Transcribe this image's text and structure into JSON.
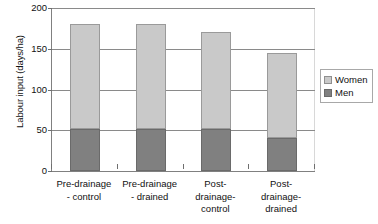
{
  "chart_data": {
    "type": "bar",
    "subtype": "stacked-column",
    "title": "",
    "xlabel": "",
    "ylabel": "Labour input (days/ha)",
    "ylim": [
      0,
      200
    ],
    "yticks": [
      0,
      50,
      100,
      150,
      200
    ],
    "ytick_labels": [
      "0",
      "50",
      "100",
      "150",
      "200"
    ],
    "grid": true,
    "grid_axis": "y",
    "legend_position": "right",
    "categories": [
      "Pre-drainage - control",
      "Pre-drainage - drained",
      "Post-drainage-control",
      "Post-drainage-drained"
    ],
    "category_lines": [
      [
        "Pre-drainage",
        "- control"
      ],
      [
        "Pre-drainage",
        "- drained"
      ],
      [
        "Post-",
        "drainage-",
        "control"
      ],
      [
        "Post-",
        "drainage-",
        "drained"
      ]
    ],
    "series": [
      {
        "name": "Men",
        "color": "#808080",
        "values": [
          51,
          51,
          51,
          41
        ]
      },
      {
        "name": "Women",
        "color": "#c9c9c9",
        "values": [
          129,
          129,
          119,
          104
        ]
      }
    ],
    "totals": [
      180,
      180,
      170,
      145
    ],
    "stack_order": [
      "Men",
      "Women"
    ],
    "legend_entries": [
      {
        "label": "Women",
        "color": "#c9c9c9"
      },
      {
        "label": "Men",
        "color": "#808080"
      }
    ]
  }
}
